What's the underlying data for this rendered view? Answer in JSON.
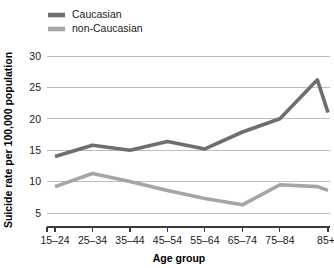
{
  "chart_data": {
    "type": "line",
    "title": "",
    "xlabel": "Age group",
    "ylabel": "Suicide rate per 100,000 population",
    "categories": [
      "15–24",
      "25–34",
      "35–44",
      "45–54",
      "55–64",
      "65–74",
      "75–84",
      "85+"
    ],
    "ylim": [
      3.5,
      31
    ],
    "yticks": [
      5,
      10,
      15,
      20,
      25,
      30
    ],
    "ytick_labels": [
      "5",
      "10",
      "15",
      "20",
      "25",
      "30"
    ],
    "grid": "horizontal",
    "legend_position": "top-left",
    "series": [
      {
        "name": "Caucasian",
        "color": "#6e6e6e",
        "values": [
          14.0,
          15.8,
          15.0,
          16.4,
          15.2,
          17.9,
          20.0,
          26.2
        ],
        "final_value": 21.0
      },
      {
        "name": "non-Caucasian",
        "color": "#a5a5a5",
        "values": [
          9.2,
          11.3,
          10.0,
          8.6,
          7.3,
          6.3,
          9.5,
          9.2
        ],
        "final_value": 8.6
      }
    ]
  },
  "legend": {
    "entries": [
      {
        "label": "Caucasian",
        "color": "#6e6e6e"
      },
      {
        "label": "non-Caucasian",
        "color": "#a5a5a5"
      }
    ]
  },
  "axes": {
    "x_title": "Age group",
    "y_title": "Suicide rate per 100,000 population"
  }
}
